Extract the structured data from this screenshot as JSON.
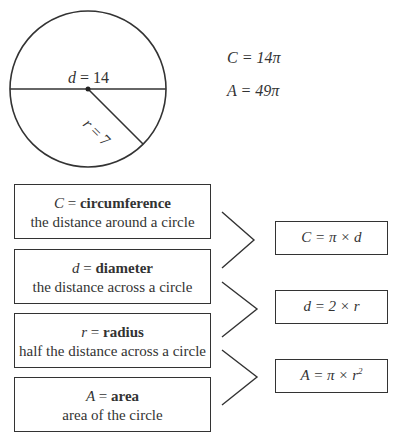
{
  "circle": {
    "diameter_label": {
      "var": "d",
      "eq": " = ",
      "val": "14"
    },
    "radius_label": {
      "var": "r",
      "eq": " = ",
      "val": "7"
    }
  },
  "results": {
    "circumference": "C = 14π",
    "area": "A = 49π"
  },
  "definitions": [
    {
      "var": "C",
      "eq": " = ",
      "term": "circumference",
      "desc": "the distance around a circle"
    },
    {
      "var": "d",
      "eq": " = ",
      "term": "diameter",
      "desc": "the distance across a circle"
    },
    {
      "var": "r",
      "eq": " = ",
      "term": "radius",
      "desc": "half the distance across a circle"
    },
    {
      "var": "A",
      "eq": " = ",
      "term": "area",
      "desc": "area of the circle"
    }
  ],
  "formulas": [
    {
      "text": "C = π × d"
    },
    {
      "text": "d = 2 × r"
    },
    {
      "text": "A = π × r",
      "sup": "2"
    }
  ]
}
